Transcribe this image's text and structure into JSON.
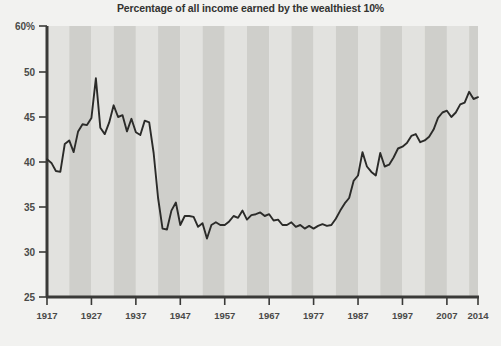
{
  "chart_data": {
    "type": "line",
    "title": "Percentage of all income earned by the wealthiest 10%",
    "xlabel": "",
    "ylabel": "",
    "ylim": [
      25,
      60
    ],
    "y_axis_broken_between": [
      50,
      60
    ],
    "y_ticks": [
      {
        "value": 60,
        "label": "60%"
      },
      {
        "value": 50,
        "label": "50"
      },
      {
        "value": 45,
        "label": "45"
      },
      {
        "value": 40,
        "label": "40"
      },
      {
        "value": 35,
        "label": "35"
      },
      {
        "value": 30,
        "label": "30"
      },
      {
        "value": 25,
        "label": "25"
      }
    ],
    "xlim": [
      1917,
      2014
    ],
    "x_ticks": [
      {
        "value": 1917,
        "label": "1917"
      },
      {
        "value": 1927,
        "label": "1927"
      },
      {
        "value": 1937,
        "label": "1937"
      },
      {
        "value": 1947,
        "label": "1947"
      },
      {
        "value": 1957,
        "label": "1957"
      },
      {
        "value": 1967,
        "label": "1967"
      },
      {
        "value": 1977,
        "label": "1977"
      },
      {
        "value": 1987,
        "label": "1987"
      },
      {
        "value": 1997,
        "label": "1997"
      },
      {
        "value": 2007,
        "label": "2007"
      },
      {
        "value": 2014,
        "label": "2014"
      }
    ],
    "grid": false,
    "legend": null,
    "background_bands": "alternating vertical gray stripes every 5 years",
    "colors": {
      "line": "#2b2b29",
      "axis": "#3a3a38",
      "band_light": "#e2e2df",
      "band_dark": "#cfcfcb",
      "page_background": "#f2f2f0",
      "title_text": "#333330",
      "tick_text": "#4a4a48"
    },
    "x": [
      1917,
      1918,
      1919,
      1920,
      1921,
      1922,
      1923,
      1924,
      1925,
      1926,
      1927,
      1928,
      1929,
      1930,
      1931,
      1932,
      1933,
      1934,
      1935,
      1936,
      1937,
      1938,
      1939,
      1940,
      1941,
      1942,
      1943,
      1944,
      1945,
      1946,
      1947,
      1948,
      1949,
      1950,
      1951,
      1952,
      1953,
      1954,
      1955,
      1956,
      1957,
      1958,
      1959,
      1960,
      1961,
      1962,
      1963,
      1964,
      1965,
      1966,
      1967,
      1968,
      1969,
      1970,
      1971,
      1972,
      1973,
      1974,
      1975,
      1976,
      1977,
      1978,
      1979,
      1980,
      1981,
      1982,
      1983,
      1984,
      1985,
      1986,
      1987,
      1988,
      1989,
      1990,
      1991,
      1992,
      1993,
      1994,
      1995,
      1996,
      1997,
      1998,
      1999,
      2000,
      2001,
      2002,
      2003,
      2004,
      2005,
      2006,
      2007,
      2008,
      2009,
      2010,
      2011,
      2012,
      2013,
      2014
    ],
    "values": [
      40.3,
      39.9,
      39.0,
      38.9,
      42.0,
      42.4,
      41.1,
      43.4,
      44.2,
      44.1,
      44.9,
      49.3,
      43.8,
      43.1,
      44.4,
      46.3,
      45.0,
      45.2,
      43.4,
      44.8,
      43.3,
      43.0,
      44.6,
      44.4,
      41.0,
      36.0,
      32.6,
      32.5,
      34.6,
      35.5,
      33.0,
      34.0,
      34.0,
      33.9,
      32.8,
      33.2,
      31.5,
      33.0,
      33.3,
      33.0,
      33.0,
      33.4,
      34.0,
      33.8,
      34.6,
      33.6,
      34.1,
      34.2,
      34.4,
      34.0,
      34.2,
      33.5,
      33.6,
      33.0,
      33.0,
      33.3,
      32.8,
      33.0,
      32.6,
      32.9,
      32.6,
      32.9,
      33.1,
      32.9,
      33.0,
      33.7,
      34.6,
      35.4,
      36.0,
      37.9,
      38.5,
      41.1,
      39.5,
      38.9,
      38.5,
      41.0,
      39.5,
      39.7,
      40.5,
      41.5,
      41.7,
      42.1,
      42.9,
      43.1,
      42.2,
      42.4,
      42.8,
      43.6,
      44.9,
      45.5,
      45.7,
      45.0,
      45.5,
      46.4,
      46.6,
      47.8,
      47.0,
      47.2
    ],
    "annotations": {
      "peak_1928": {
        "year": 1928,
        "value": 49.3
      },
      "trough_1944": {
        "year": 1944,
        "value": 32.5
      },
      "peak_2012": {
        "year": 2012,
        "value": 47.8
      }
    }
  }
}
